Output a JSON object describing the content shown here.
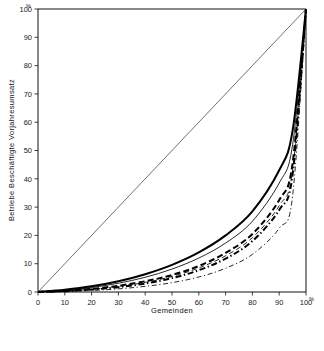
{
  "chart_data": {
    "type": "line",
    "title": "",
    "xlabel": "Gemeinden",
    "ylabel": "Betriebe  Beschäftigte  Vorjahresumsatz",
    "x_unit": "%",
    "y_unit": "%",
    "xlim": [
      0,
      100
    ],
    "ylim": [
      0,
      100
    ],
    "xticks": [
      0,
      10,
      20,
      30,
      40,
      50,
      60,
      70,
      80,
      90,
      100
    ],
    "yticks": [
      0,
      10,
      20,
      30,
      40,
      50,
      60,
      70,
      80,
      90,
      100
    ],
    "xtick_labels": [
      "0",
      "10",
      "20",
      "30",
      "40",
      "50",
      "60",
      "70",
      "80",
      "90",
      "100"
    ],
    "ytick_labels": [
      "0",
      "10",
      "20",
      "30",
      "40",
      "50",
      "60",
      "70",
      "80",
      "90",
      "100"
    ],
    "grid": false,
    "legend_position": "below",
    "reference_line": {
      "name": "equal-distribution-diagonal",
      "x": [
        0,
        100
      ],
      "y": [
        0,
        100
      ]
    },
    "x": [
      0,
      10,
      20,
      30,
      40,
      50,
      60,
      70,
      80,
      90,
      95,
      100
    ],
    "series": [
      {
        "name": "Betriebe Alpen",
        "style": "solid",
        "width": "thick",
        "color": "#000000",
        "values": [
          0,
          0.8,
          2.0,
          3.8,
          6.3,
          9.6,
          14.0,
          20.0,
          28.5,
          43.0,
          57.0,
          100
        ]
      },
      {
        "name": "Betriebe Bayern",
        "style": "solid",
        "width": "thin",
        "color": "#000000",
        "values": [
          0,
          0.6,
          1.6,
          3.1,
          5.2,
          8.1,
          12.0,
          17.3,
          25.0,
          38.5,
          52.0,
          100
        ]
      },
      {
        "name": "Beschäftigte Alpen",
        "style": "dashed",
        "width": "thick",
        "color": "#000000",
        "values": [
          0,
          0.4,
          1.1,
          2.2,
          3.8,
          6.0,
          9.2,
          13.8,
          20.5,
          32.5,
          45.5,
          100
        ]
      },
      {
        "name": "Beschäftigte Bayern",
        "style": "dashed",
        "width": "thin",
        "color": "#000000",
        "values": [
          0,
          0.35,
          1.0,
          2.0,
          3.4,
          5.5,
          8.5,
          12.8,
          19.2,
          30.5,
          43.0,
          100
        ]
      },
      {
        "name": "Umsatz Alpen",
        "style": "dash-dot",
        "width": "thick",
        "color": "#000000",
        "values": [
          0,
          0.3,
          0.85,
          1.7,
          3.0,
          4.9,
          7.7,
          11.8,
          18.0,
          29.0,
          41.5,
          100
        ]
      },
      {
        "name": "Umsatz Bayern",
        "style": "dash-dot",
        "width": "thin",
        "color": "#000000",
        "values": [
          0,
          0.2,
          0.55,
          1.1,
          2.0,
          3.3,
          5.3,
          8.4,
          13.3,
          22.5,
          34.0,
          100
        ]
      }
    ]
  },
  "axes": {
    "y_unit_label": "%",
    "x_unit_label": "%",
    "x_title": "Gemeinden",
    "y_title": "Betriebe  Beschäftigte  Vorjahresumsatz"
  },
  "legend": {
    "entries": [
      {
        "label": "Betriebe Alpen",
        "style": "solid",
        "width": "thick"
      },
      {
        "label": "Beschäftigte Alpen",
        "style": "dashed",
        "width": "thick"
      },
      {
        "label": "Umsatz Alpen",
        "style": "dash-dot",
        "width": "thick"
      },
      {
        "label": "Betriebe Bayern",
        "style": "solid",
        "width": "thin"
      },
      {
        "label": "Beschäftigte Bayern",
        "style": "dashed",
        "width": "thin"
      },
      {
        "label": "Umsatz Bayern",
        "style": "dash-dot",
        "width": "thin"
      }
    ]
  }
}
